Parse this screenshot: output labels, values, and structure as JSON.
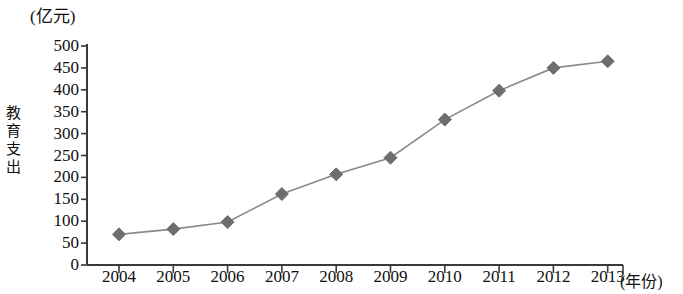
{
  "chart_data": {
    "type": "line",
    "title": "",
    "subtitle": "",
    "xlabel": "(年份)",
    "ylabel": "教育支出",
    "unit_label": "(亿元)",
    "categories": [
      "2004",
      "2005",
      "2006",
      "2007",
      "2008",
      "2009",
      "2010",
      "2011",
      "2012",
      "2013"
    ],
    "values": [
      70,
      82,
      98,
      162,
      207,
      245,
      332,
      398,
      450,
      465
    ],
    "series": [
      {
        "name": "教育支出",
        "values": [
          70,
          82,
          98,
          162,
          207,
          245,
          332,
          398,
          450,
          465
        ]
      }
    ],
    "ylim": [
      0,
      500
    ],
    "yticks": [
      "0",
      "50",
      "100",
      "150",
      "200",
      "250",
      "300",
      "350",
      "400",
      "450",
      "500"
    ],
    "ytick_values": [
      0,
      50,
      100,
      150,
      200,
      250,
      300,
      350,
      400,
      450,
      500
    ],
    "grid": false,
    "legend": "none",
    "marker": "diamond",
    "marker_color": "#6e6e6e",
    "line_color": "#8a8a8a",
    "axis_color": "#3a3a3a"
  },
  "axis": {
    "y_title_chars": [
      "教",
      "育",
      "支",
      "出"
    ]
  }
}
